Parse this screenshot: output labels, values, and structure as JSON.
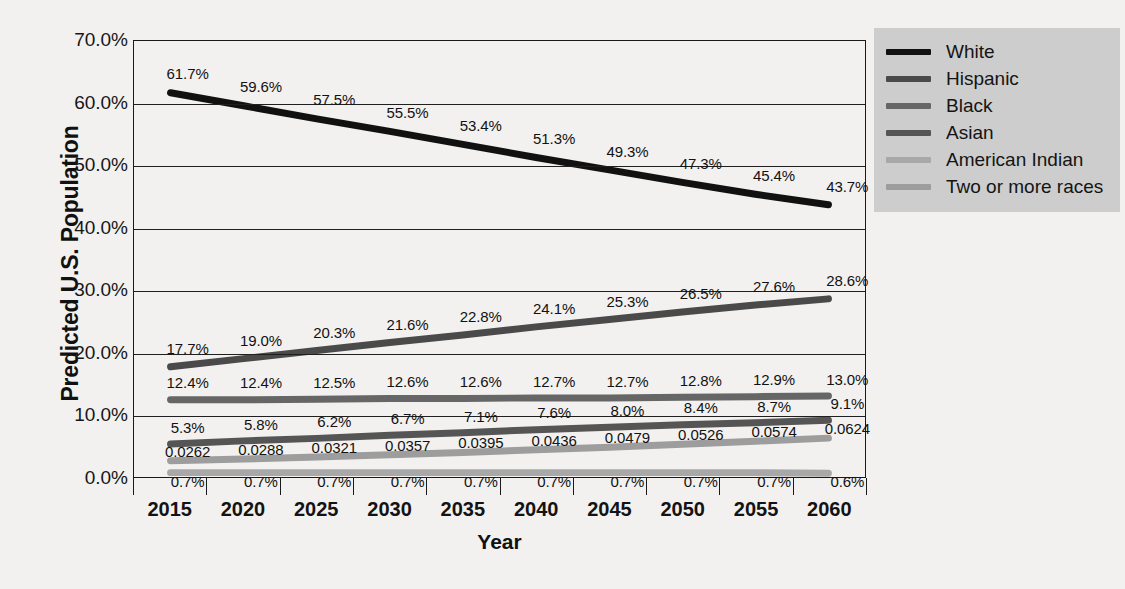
{
  "chart_data": {
    "type": "line",
    "title": "",
    "xlabel": "Year",
    "ylabel": "Predicted U.S. Population",
    "categories": [
      "2015",
      "2020",
      "2025",
      "2030",
      "2035",
      "2040",
      "2045",
      "2050",
      "2055",
      "2060"
    ],
    "ylim": [
      0,
      70
    ],
    "ytick_labels": [
      "0.0%",
      "10.0%",
      "20.0%",
      "30.0%",
      "40.0%",
      "50.0%",
      "60.0%",
      "70.0%"
    ],
    "ytick_values": [
      0,
      10,
      20,
      30,
      40,
      50,
      60,
      70
    ],
    "grid": true,
    "legend_position": "right",
    "series": [
      {
        "name": "White",
        "color": "#111111",
        "values": [
          61.7,
          59.6,
          57.5,
          55.5,
          53.4,
          51.3,
          49.3,
          47.3,
          45.4,
          43.7
        ],
        "labels": [
          "61.7%",
          "59.6%",
          "57.5%",
          "55.5%",
          "53.4%",
          "51.3%",
          "49.3%",
          "47.3%",
          "45.4%",
          "43.7%"
        ]
      },
      {
        "name": "Hispanic",
        "color": "#4a4a4a",
        "values": [
          17.7,
          19.0,
          20.3,
          21.6,
          22.8,
          24.1,
          25.3,
          26.5,
          27.6,
          28.6
        ],
        "labels": [
          "17.7%",
          "19.0%",
          "20.3%",
          "21.6%",
          "22.8%",
          "24.1%",
          "25.3%",
          "26.5%",
          "27.6%",
          "28.6%"
        ]
      },
      {
        "name": "Black",
        "color": "#666666",
        "values": [
          12.4,
          12.4,
          12.5,
          12.6,
          12.6,
          12.7,
          12.7,
          12.8,
          12.9,
          13.0
        ],
        "labels": [
          "12.4%",
          "12.4%",
          "12.5%",
          "12.6%",
          "12.6%",
          "12.7%",
          "12.7%",
          "12.8%",
          "12.9%",
          "13.0%"
        ]
      },
      {
        "name": "Asian",
        "color": "#555555",
        "values": [
          5.3,
          5.8,
          6.2,
          6.7,
          7.1,
          7.6,
          8.0,
          8.4,
          8.7,
          9.1
        ],
        "labels": [
          "5.3%",
          "5.8%",
          "6.2%",
          "6.7%",
          "7.1%",
          "7.6%",
          "8.0%",
          "8.4%",
          "8.7%",
          "9.1%"
        ]
      },
      {
        "name": "American Indian",
        "color": "#a8a8a8",
        "values": [
          0.7,
          0.7,
          0.7,
          0.7,
          0.7,
          0.7,
          0.7,
          0.7,
          0.7,
          0.6
        ],
        "labels": [
          "0.7%",
          "0.7%",
          "0.7%",
          "0.7%",
          "0.7%",
          "0.7%",
          "0.7%",
          "0.7%",
          "0.7%",
          "0.6%"
        ]
      },
      {
        "name": "Two or more races",
        "color": "#9d9d9d",
        "values": [
          2.62,
          2.88,
          3.21,
          3.57,
          3.95,
          4.36,
          4.79,
          5.26,
          5.74,
          6.24
        ],
        "labels": [
          "0.0262",
          "0.0288",
          "0.0321",
          "0.0357",
          "0.0395",
          "0.0436",
          "0.0479",
          "0.0526",
          "0.0574",
          "0.0624"
        ]
      }
    ]
  },
  "legend": {
    "entries": [
      {
        "label": "White",
        "color": "#111111"
      },
      {
        "label": "Hispanic",
        "color": "#4a4a4a"
      },
      {
        "label": "Black",
        "color": "#666666"
      },
      {
        "label": "Asian",
        "color": "#555555"
      },
      {
        "label": "American Indian",
        "color": "#a8a8a8"
      },
      {
        "label": "Two or more races",
        "color": "#9d9d9d"
      }
    ],
    "background": "#cdcdcd"
  }
}
